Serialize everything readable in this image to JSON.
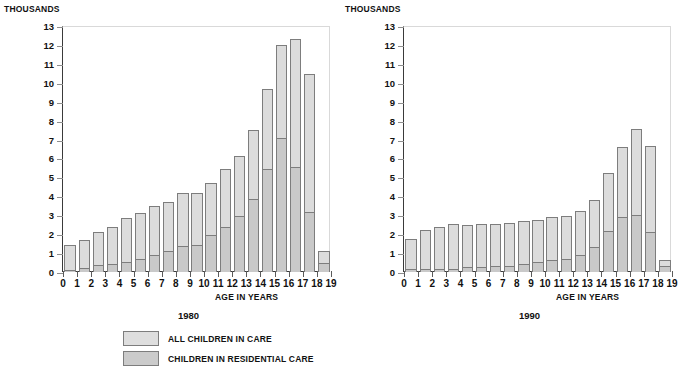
{
  "figure": {
    "units_label": "THOUSANDS",
    "x_axis_title": "AGE IN YEARS",
    "y_ticks": [
      13,
      12,
      11,
      10,
      9,
      8,
      7,
      6,
      5,
      4,
      3,
      2,
      1,
      0
    ],
    "x_ticks": [
      0,
      1,
      2,
      3,
      4,
      5,
      6,
      7,
      8,
      9,
      10,
      11,
      12,
      13,
      14,
      15,
      16,
      17,
      18,
      19
    ],
    "colors": {
      "all_children": "#dcdcdc",
      "residential": "#c9c9c9",
      "bar_outline": "#7d7d7d",
      "axis": "#3a3a3a",
      "text": "#111111"
    }
  },
  "legend": {
    "position": "bottom-center",
    "entries": [
      {
        "label": "ALL CHILDREN IN CARE",
        "color": "#dedede"
      },
      {
        "label": "CHILDREN IN RESIDENTIAL CARE",
        "color": "#cbcbcb"
      }
    ]
  },
  "panels": [
    {
      "caption": "1980",
      "units_label": "THOUSANDS",
      "x_axis_title": "AGE IN YEARS"
    },
    {
      "caption": "1990",
      "units_label": "THOUSANDS",
      "x_axis_title": "AGE IN YEARS"
    }
  ],
  "chart_data": [
    {
      "type": "bar",
      "title": "1980",
      "subtitle": "",
      "xlabel": "AGE IN YEARS",
      "ylabel": "THOUSANDS",
      "ylim": [
        0,
        13
      ],
      "xlim": [
        0,
        19
      ],
      "grid": false,
      "stacked": true,
      "legend_position": "bottom-center",
      "categories": [
        0,
        1,
        2,
        3,
        4,
        5,
        6,
        7,
        8,
        9,
        10,
        11,
        12,
        13,
        14,
        15,
        16,
        17,
        18
      ],
      "series": [
        {
          "name": "ALL CHILDREN IN CARE",
          "values": [
            1.35,
            1.62,
            2.08,
            2.35,
            2.78,
            3.05,
            3.42,
            3.65,
            4.1,
            4.12,
            4.65,
            5.4,
            6.1,
            7.45,
            9.6,
            11.95,
            12.25,
            10.4,
            1.05
          ]
        },
        {
          "name": "CHILDREN IN RESIDENTIAL CARE",
          "values": [
            0.1,
            0.2,
            0.38,
            0.42,
            0.55,
            0.68,
            0.92,
            1.12,
            1.38,
            1.45,
            1.95,
            2.4,
            2.98,
            3.88,
            5.42,
            7.1,
            5.55,
            3.15,
            0.48
          ]
        }
      ]
    },
    {
      "type": "bar",
      "title": "1990",
      "subtitle": "",
      "xlabel": "AGE IN YEARS",
      "ylabel": "THOUSANDS",
      "ylim": [
        0,
        13
      ],
      "xlim": [
        0,
        19
      ],
      "grid": false,
      "stacked": true,
      "legend_position": "bottom-center",
      "categories": [
        0,
        1,
        2,
        3,
        4,
        5,
        6,
        7,
        8,
        9,
        10,
        11,
        12,
        13,
        14,
        15,
        16,
        17,
        18
      ],
      "series": [
        {
          "name": "ALL CHILDREN IN CARE",
          "values": [
            1.7,
            2.15,
            2.3,
            2.48,
            2.45,
            2.48,
            2.48,
            2.52,
            2.62,
            2.68,
            2.88,
            2.93,
            3.18,
            3.75,
            5.18,
            6.55,
            7.48,
            6.6,
            0.58
          ]
        },
        {
          "name": "CHILDREN IN RESIDENTIAL CARE",
          "values": [
            0.15,
            0.15,
            0.15,
            0.16,
            0.25,
            0.25,
            0.3,
            0.32,
            0.42,
            0.52,
            0.62,
            0.68,
            0.88,
            1.32,
            2.15,
            2.9,
            3.02,
            2.1,
            0.3
          ]
        }
      ]
    }
  ]
}
